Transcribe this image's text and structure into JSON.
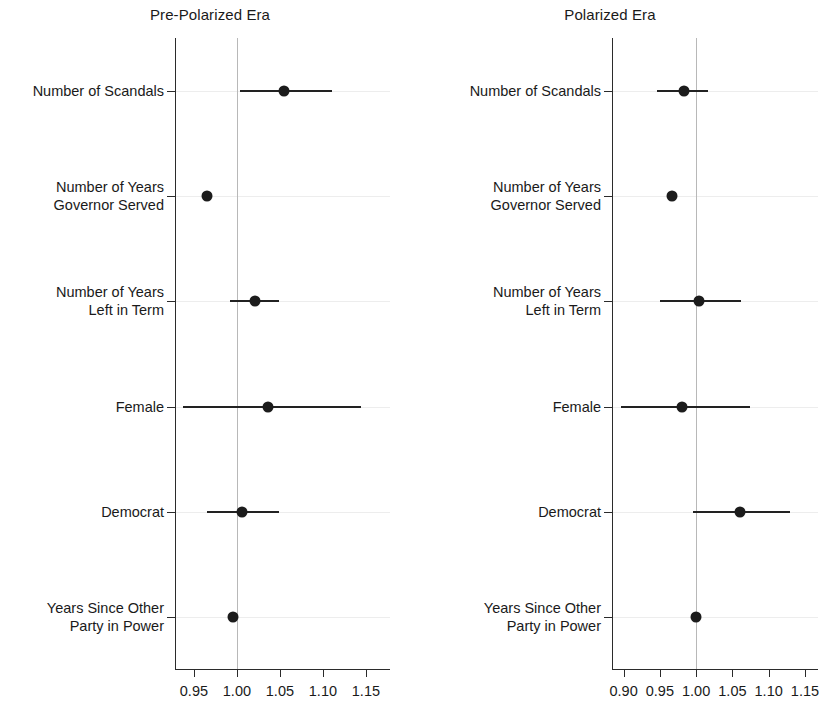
{
  "figure": {
    "background_color": "#ffffff",
    "point_color": "#1c1c1c",
    "line_color": "#222222",
    "reference_line_color": "#b8b8b8",
    "axis_color": "#2b2b2b"
  },
  "chart_data": {
    "type": "scatter",
    "subtype": "coefficient-plot-with-confidence-intervals",
    "title": "",
    "xlabel": "",
    "ylabel": "",
    "grid": true,
    "legend": null,
    "reference_line_x": 1.0,
    "categories": [
      "Number of Scandals",
      "Number of Years Governor Served",
      "Number of Years Left in Term",
      "Female",
      "Democrat",
      "Years Since Other Party in Power"
    ],
    "panels": [
      {
        "title": "Pre-Polarized Era",
        "xlim": [
          0.928,
          1.178
        ],
        "xticks": [
          0.95,
          1.0,
          1.05,
          1.1,
          1.15
        ],
        "xticklabels": [
          "0.95",
          "1.00",
          "1.05",
          "1.10",
          "1.15"
        ],
        "rows": [
          {
            "label_lines": [
              "Number of Scandals"
            ],
            "estimate": 1.055,
            "ci_low": 1.004,
            "ci_high": 1.11
          },
          {
            "label_lines": [
              "Number of Years",
              "Governor Served"
            ],
            "estimate": 0.965,
            "ci_low": 0.963,
            "ci_high": 0.967
          },
          {
            "label_lines": [
              "Number of Years",
              "Left in Term"
            ],
            "estimate": 1.021,
            "ci_low": 0.992,
            "ci_high": 1.049
          },
          {
            "label_lines": [
              "Female"
            ],
            "estimate": 1.036,
            "ci_low": 0.937,
            "ci_high": 1.144
          },
          {
            "label_lines": [
              "Democrat"
            ],
            "estimate": 1.006,
            "ci_low": 0.965,
            "ci_high": 1.049
          },
          {
            "label_lines": [
              "Years Since Other",
              "Party in Power"
            ],
            "estimate": 0.996,
            "ci_low": 0.994,
            "ci_high": 0.998
          }
        ]
      },
      {
        "title": "Polarized Era",
        "xlim": [
          0.884,
          1.168
        ],
        "xticks": [
          0.9,
          0.95,
          1.0,
          1.05,
          1.1,
          1.15
        ],
        "xticklabels": [
          "0.90",
          "0.95",
          "1.00",
          "1.05",
          "1.10",
          "1.15"
        ],
        "rows": [
          {
            "label_lines": [
              "Number of Scandals"
            ],
            "estimate": 0.983,
            "ci_low": 0.946,
            "ci_high": 1.017
          },
          {
            "label_lines": [
              "Number of Years",
              "Governor Served"
            ],
            "estimate": 0.967,
            "ci_low": 0.965,
            "ci_high": 0.969
          },
          {
            "label_lines": [
              "Number of Years",
              "Left in Term"
            ],
            "estimate": 1.004,
            "ci_low": 0.95,
            "ci_high": 1.062
          },
          {
            "label_lines": [
              "Female"
            ],
            "estimate": 0.98,
            "ci_low": 0.896,
            "ci_high": 1.074
          },
          {
            "label_lines": [
              "Democrat"
            ],
            "estimate": 1.061,
            "ci_low": 0.996,
            "ci_high": 1.129
          },
          {
            "label_lines": [
              "Years Since Other",
              "Party in Power"
            ],
            "estimate": 1.0,
            "ci_low": 0.998,
            "ci_high": 1.002
          }
        ]
      }
    ]
  }
}
